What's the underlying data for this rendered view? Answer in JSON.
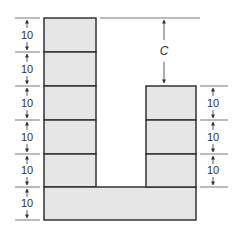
{
  "diagram": {
    "fill_color": "#e6e6e6",
    "stroke_color": "#333333",
    "left_column": {
      "block_count": 6,
      "dimensions": [
        "10",
        "10",
        "10",
        "10",
        "10",
        "10"
      ]
    },
    "right_column": {
      "block_count": 3,
      "dimensions": [
        "10",
        "10",
        "10"
      ]
    },
    "gap_label": "C"
  }
}
